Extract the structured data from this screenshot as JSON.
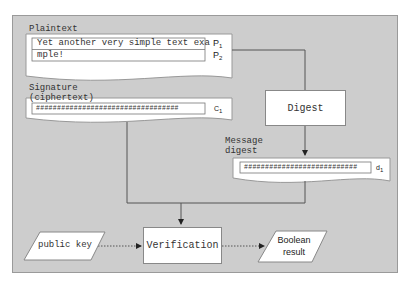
{
  "plaintext": {
    "label": "Plaintext",
    "line1": "Yet another very simple text exa",
    "line2": "mple!",
    "p1": "P",
    "p1_sub": "1",
    "p2": "P",
    "p2_sub": "2"
  },
  "signature": {
    "label_line1": "Signature",
    "label_line2": "(ciphertext)",
    "value": "##################################",
    "c": "C",
    "c_sub": "1"
  },
  "digest_box": {
    "label": "Digest"
  },
  "message_digest": {
    "label_line1": "Message",
    "label_line2": "digest",
    "value": "###########################",
    "d": "d",
    "d_sub": "1"
  },
  "public_key": {
    "label": "public key"
  },
  "verification": {
    "label": "Verification"
  },
  "boolean_result": {
    "line1": "Boolean",
    "line2": "result"
  },
  "colors": {
    "panel": "#cdcdcd",
    "box": "#ffffff",
    "line": "#555555"
  }
}
